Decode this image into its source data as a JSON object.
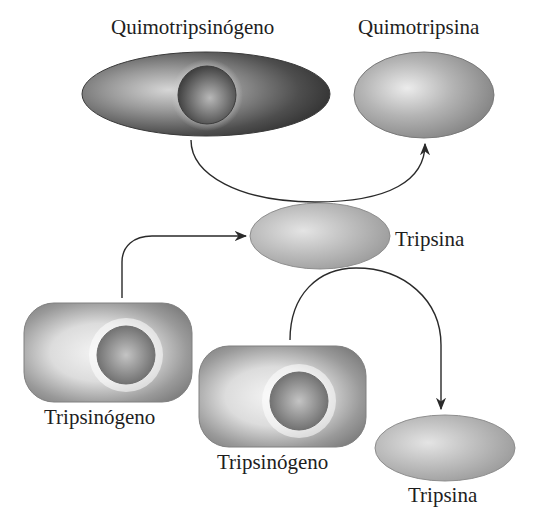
{
  "diagram": {
    "nodes": [
      {
        "id": "quimotripsinogeno",
        "label": "Quimotripsinógeno",
        "type": "zymogen"
      },
      {
        "id": "quimotripsina",
        "label": "Quimotripsina",
        "type": "active-enzyme"
      },
      {
        "id": "tripsina_1",
        "label": "Tripsina",
        "type": "active-enzyme"
      },
      {
        "id": "tripsinogeno_1",
        "label": "Tripsinógeno",
        "type": "zymogen"
      },
      {
        "id": "tripsinogeno_2",
        "label": "Tripsinógeno",
        "type": "zymogen"
      },
      {
        "id": "tripsina_2",
        "label": "Tripsina",
        "type": "active-enzyme"
      }
    ],
    "edges": [
      {
        "from": "quimotripsinogeno",
        "to": "quimotripsina",
        "via": "tripsina_1"
      },
      {
        "from": "tripsinogeno_1",
        "to": "tripsina_1"
      },
      {
        "from": "tripsinogeno_2",
        "to": "tripsina_2",
        "via": "tripsina_1"
      }
    ]
  },
  "labels": {
    "quimotripsinogeno": "Quimotripsinógeno",
    "quimotripsina": "Quimotripsina",
    "tripsina_mid": "Tripsina",
    "tripsinogeno_left": "Tripsinógeno",
    "tripsinogeno_right": "Tripsinógeno",
    "tripsina_bottom": "Tripsina"
  },
  "colors": {
    "background": "#ffffff",
    "text": "#1e1e1e",
    "arrow": "#2a2a2a",
    "zymogen_dark": "#3a3a3a",
    "enzyme_gray": "#8c8c8c",
    "highlight": "#e6e6e6"
  }
}
